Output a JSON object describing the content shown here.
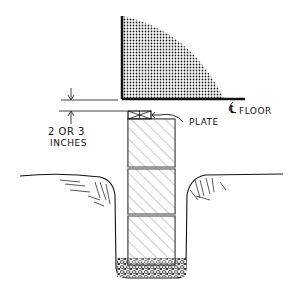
{
  "diagram": {
    "labels": {
      "floor": "FLOOR",
      "floor_marker": "℄",
      "plate": "PLATE",
      "clearance_line1": "2 OR 3",
      "clearance_line2": "INCHES"
    },
    "components": [
      "shaded floor quadrant",
      "floor line",
      "plate",
      "concrete blocks (3)",
      "gravel footing",
      "ground line",
      "trench"
    ],
    "colors": {
      "ink": "#111111",
      "background": "#ffffff"
    }
  }
}
